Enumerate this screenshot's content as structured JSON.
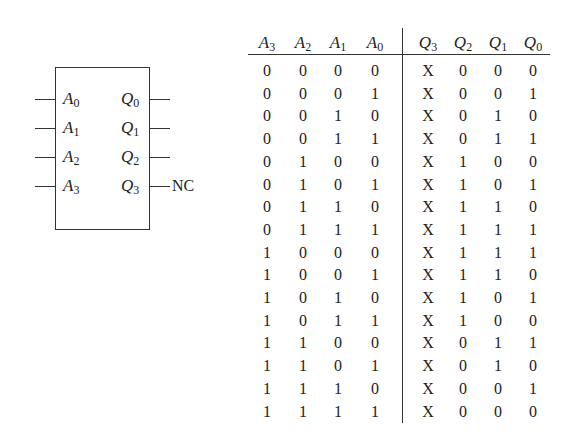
{
  "diagram": {
    "block": {
      "inputs": [
        {
          "name": "A",
          "sub": "0"
        },
        {
          "name": "A",
          "sub": "1"
        },
        {
          "name": "A",
          "sub": "2"
        },
        {
          "name": "A",
          "sub": "3"
        }
      ],
      "outputs": [
        {
          "name": "Q",
          "sub": "0"
        },
        {
          "name": "Q",
          "sub": "1"
        },
        {
          "name": "Q",
          "sub": "2"
        },
        {
          "name": "Q",
          "sub": "3"
        }
      ],
      "nc_label": "NC"
    },
    "table": {
      "headers": [
        {
          "name": "A",
          "sub": "3"
        },
        {
          "name": "A",
          "sub": "2"
        },
        {
          "name": "A",
          "sub": "1"
        },
        {
          "name": "A",
          "sub": "0"
        },
        {
          "name": "Q",
          "sub": "3"
        },
        {
          "name": "Q",
          "sub": "2"
        },
        {
          "name": "Q",
          "sub": "1"
        },
        {
          "name": "Q",
          "sub": "0"
        }
      ],
      "rows": [
        [
          "0",
          "0",
          "0",
          "0",
          "X",
          "0",
          "0",
          "0"
        ],
        [
          "0",
          "0",
          "0",
          "1",
          "X",
          "0",
          "0",
          "1"
        ],
        [
          "0",
          "0",
          "1",
          "0",
          "X",
          "0",
          "1",
          "0"
        ],
        [
          "0",
          "0",
          "1",
          "1",
          "X",
          "0",
          "1",
          "1"
        ],
        [
          "0",
          "1",
          "0",
          "0",
          "X",
          "1",
          "0",
          "0"
        ],
        [
          "0",
          "1",
          "0",
          "1",
          "X",
          "1",
          "0",
          "1"
        ],
        [
          "0",
          "1",
          "1",
          "0",
          "X",
          "1",
          "1",
          "0"
        ],
        [
          "0",
          "1",
          "1",
          "1",
          "X",
          "1",
          "1",
          "1"
        ],
        [
          "1",
          "0",
          "0",
          "0",
          "X",
          "1",
          "1",
          "1"
        ],
        [
          "1",
          "0",
          "0",
          "1",
          "X",
          "1",
          "1",
          "0"
        ],
        [
          "1",
          "0",
          "1",
          "0",
          "X",
          "1",
          "0",
          "1"
        ],
        [
          "1",
          "0",
          "1",
          "1",
          "X",
          "1",
          "0",
          "0"
        ],
        [
          "1",
          "1",
          "0",
          "0",
          "X",
          "0",
          "1",
          "1"
        ],
        [
          "1",
          "1",
          "0",
          "1",
          "X",
          "0",
          "1",
          "0"
        ],
        [
          "1",
          "1",
          "1",
          "0",
          "X",
          "0",
          "0",
          "1"
        ],
        [
          "1",
          "1",
          "1",
          "1",
          "X",
          "0",
          "0",
          "0"
        ]
      ]
    }
  }
}
